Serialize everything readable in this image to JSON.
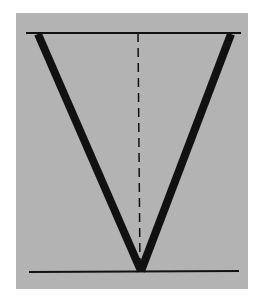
{
  "figure": {
    "background": "#ffffff",
    "panel_color": "#b3b3b3",
    "line_color": "#111111",
    "shapes": {
      "top_line": {
        "x1": 26,
        "y1": 33,
        "x2": 241,
        "y2": 33
      },
      "bottom_line": {
        "x1": 29,
        "y1": 272,
        "x2": 239,
        "y2": 271
      },
      "left_arm": {
        "x1": 38,
        "y1": 34,
        "x2": 141,
        "y2": 271
      },
      "right_arm": {
        "x1": 231,
        "y1": 34,
        "x2": 141,
        "y2": 271
      },
      "center_dashed": {
        "x1": 138,
        "y1": 33,
        "x2": 140,
        "y2": 268
      }
    }
  }
}
